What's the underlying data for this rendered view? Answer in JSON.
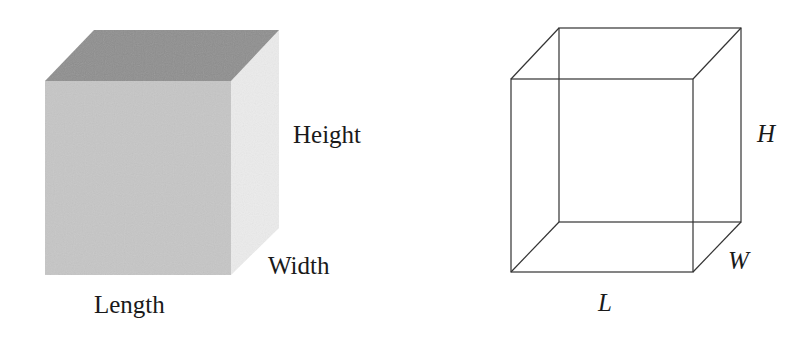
{
  "figures": {
    "shaded_cube": {
      "labels": {
        "height": "Height",
        "width": "Width",
        "length": "Length"
      },
      "colors": {
        "top_face": "#8e8e8e",
        "front_face": "#c6c6c6",
        "side_face": "#ececec"
      }
    },
    "wireframe_cube": {
      "labels": {
        "height": "H",
        "width": "W",
        "length": "L"
      },
      "colors": {
        "edge": "#333333"
      }
    }
  }
}
